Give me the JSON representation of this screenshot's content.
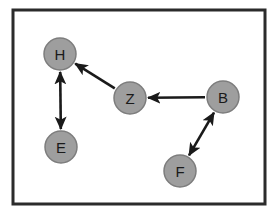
{
  "canvas": {
    "width": 280,
    "height": 217,
    "background": "#ffffff"
  },
  "frame": {
    "name": "diagram-border",
    "x": 13,
    "y": 10,
    "width": 252,
    "height": 194,
    "stroke": "#2b2b2b",
    "stroke_width": 3
  },
  "style": {
    "node_fill": "#9e9e9e",
    "node_stroke": "#7d7d7d",
    "node_stroke_width": 1.5,
    "node_radius": 16,
    "label_color": "#1a1a1a",
    "label_font_size": 15,
    "edge_color": "#1a1a1a",
    "edge_width": 2.6,
    "arrow_size": 7
  },
  "chart_data": {
    "type": "diagram",
    "subtype": "directed-graph",
    "title": "",
    "nodes": [
      {
        "id": "H",
        "label": "H",
        "x": 60,
        "y": 54
      },
      {
        "id": "E",
        "label": "E",
        "x": 61,
        "y": 147
      },
      {
        "id": "Z",
        "label": "Z",
        "x": 130,
        "y": 98
      },
      {
        "id": "B",
        "label": "B",
        "x": 223,
        "y": 97
      },
      {
        "id": "F",
        "label": "F",
        "x": 180,
        "y": 171
      }
    ],
    "edges": [
      {
        "from": "H",
        "to": "E",
        "direction": "both",
        "label": ""
      },
      {
        "from": "Z",
        "to": "H",
        "direction": "forward",
        "label": ""
      },
      {
        "from": "B",
        "to": "Z",
        "direction": "forward",
        "label": ""
      },
      {
        "from": "B",
        "to": "F",
        "direction": "both",
        "label": ""
      }
    ],
    "node_count": 5,
    "edge_count": 4
  }
}
